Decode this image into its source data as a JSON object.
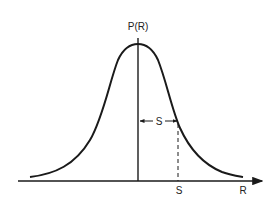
{
  "diagram": {
    "type": "bell-curve",
    "colors": {
      "line": "#1a1a1a",
      "background": "#ffffff"
    },
    "labels": {
      "y_axis": "P(R)",
      "x_axis": "R",
      "spread_bracket": "S",
      "spread_tick": "S"
    }
  }
}
